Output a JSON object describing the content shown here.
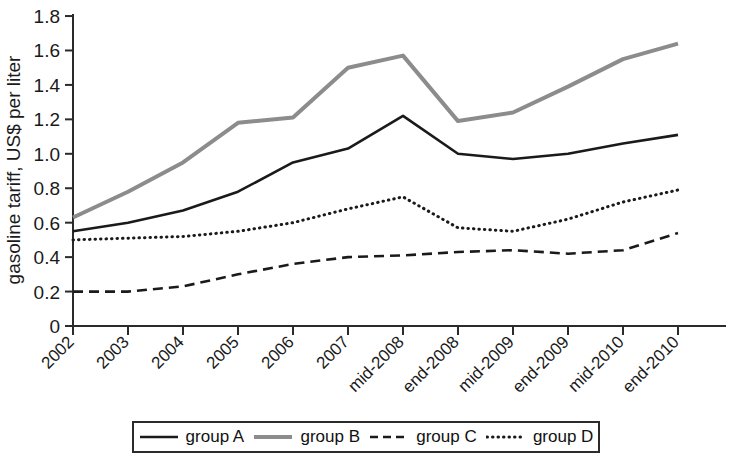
{
  "chart_data": {
    "type": "line",
    "title": "",
    "xlabel": "",
    "ylabel": "gasoline tariff, US$ per liter",
    "categories": [
      "2002",
      "2003",
      "2004",
      "2005",
      "2006",
      "2007",
      "mid-2008",
      "end-2008",
      "mid-2009",
      "end-2009",
      "mid-2010",
      "end-2010"
    ],
    "ylim": [
      0,
      1.8
    ],
    "ytick_labels": [
      "0",
      "0.2",
      "0.4",
      "0.6",
      "0.8",
      "1.0",
      "1.2",
      "1.4",
      "1.6",
      "1.8"
    ],
    "ytick_values": [
      0,
      0.2,
      0.4,
      0.6,
      0.8,
      1.0,
      1.2,
      1.4,
      1.6,
      1.8
    ],
    "grid": false,
    "legend_position": "bottom",
    "series": [
      {
        "name": "group A",
        "style": "solid",
        "color": "#1a1a1a",
        "width": 2.6,
        "values": [
          0.55,
          0.6,
          0.67,
          0.78,
          0.95,
          1.03,
          1.22,
          1.0,
          0.97,
          1.0,
          1.06,
          1.11
        ]
      },
      {
        "name": "group B",
        "style": "solid",
        "color": "#8c8c8c",
        "width": 4.0,
        "values": [
          0.63,
          0.78,
          0.95,
          1.18,
          1.21,
          1.5,
          1.57,
          1.19,
          1.24,
          1.39,
          1.55,
          1.64
        ]
      },
      {
        "name": "group C",
        "style": "dashed",
        "color": "#1a1a1a",
        "width": 2.6,
        "values": [
          0.2,
          0.2,
          0.23,
          0.3,
          0.36,
          0.4,
          0.41,
          0.43,
          0.44,
          0.42,
          0.44,
          0.54
        ]
      },
      {
        "name": "group D",
        "style": "dotted",
        "color": "#1a1a1a",
        "width": 3.0,
        "values": [
          0.5,
          0.51,
          0.52,
          0.55,
          0.6,
          0.68,
          0.75,
          0.57,
          0.55,
          0.62,
          0.72,
          0.79
        ]
      }
    ]
  },
  "legend": {
    "items": [
      {
        "label": "group A",
        "style": "solid",
        "color": "#1a1a1a"
      },
      {
        "label": "group B",
        "style": "solid",
        "color": "#8c8c8c"
      },
      {
        "label": "group C",
        "style": "dashed",
        "color": "#1a1a1a"
      },
      {
        "label": "group D",
        "style": "dotted",
        "color": "#1a1a1a"
      }
    ]
  }
}
